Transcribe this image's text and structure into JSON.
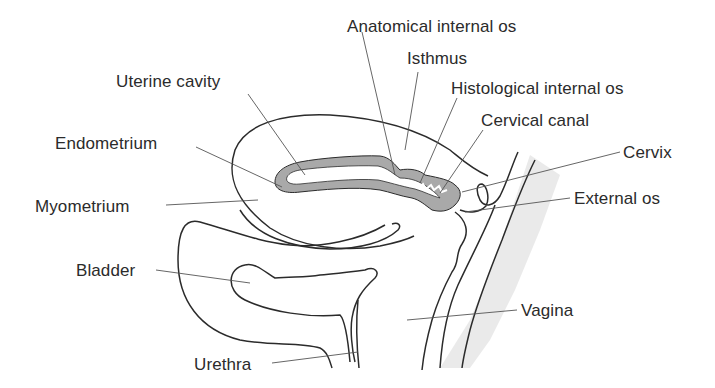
{
  "colors": {
    "outline": "#2b2b2b",
    "endometrium_fill": "#a9a9a9",
    "leader_line": "#555555",
    "shadow": "#e6e6e6",
    "text": "#2b2b2b"
  },
  "labels": {
    "anatomical_internal_os": "Anatomical internal os",
    "isthmus": "Isthmus",
    "uterine_cavity": "Uterine cavity",
    "histological_internal_os": "Histological internal os",
    "cervical_canal": "Cervical canal",
    "endometrium": "Endometrium",
    "cervix": "Cervix",
    "myometrium": "Myometrium",
    "external_os": "External os",
    "bladder": "Bladder",
    "vagina": "Vagina",
    "urethra": "Urethra"
  }
}
